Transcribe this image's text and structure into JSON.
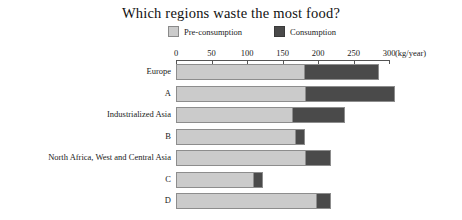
{
  "chart_data": {
    "type": "bar",
    "orientation": "horizontal",
    "stacked": true,
    "title": "Which regions waste the most food?",
    "xlabel": "(kg/year)",
    "ylabel": "",
    "xlim": [
      0,
      300
    ],
    "xticks": [
      0,
      50,
      100,
      150,
      200,
      250,
      300
    ],
    "xtick_labels": [
      "0",
      "50",
      "100",
      "150",
      "200",
      "250",
      "300"
    ],
    "unit_label": "(kg/year)",
    "grid": false,
    "legend_position": "top",
    "categories": [
      "Europe",
      "A",
      "Industrialized Asia",
      "B",
      "North Africa, West and Central Asia",
      "C",
      "D"
    ],
    "series": [
      {
        "name": "Pre-consumption",
        "color": "#cbcbcb",
        "values": [
          180,
          181,
          163,
          167,
          182,
          108,
          197
        ]
      },
      {
        "name": "Consumption",
        "color": "#4a4a4a",
        "values": [
          103,
          124,
          72,
          12,
          33,
          12,
          18
        ]
      }
    ],
    "totals": [
      283,
      305,
      235,
      179,
      215,
      120,
      215
    ]
  },
  "legend": {
    "items": [
      {
        "label": "Pre-consumption",
        "swatch": "light-gray-square"
      },
      {
        "label": "Consumption",
        "swatch": "dark-gray-square"
      }
    ]
  }
}
